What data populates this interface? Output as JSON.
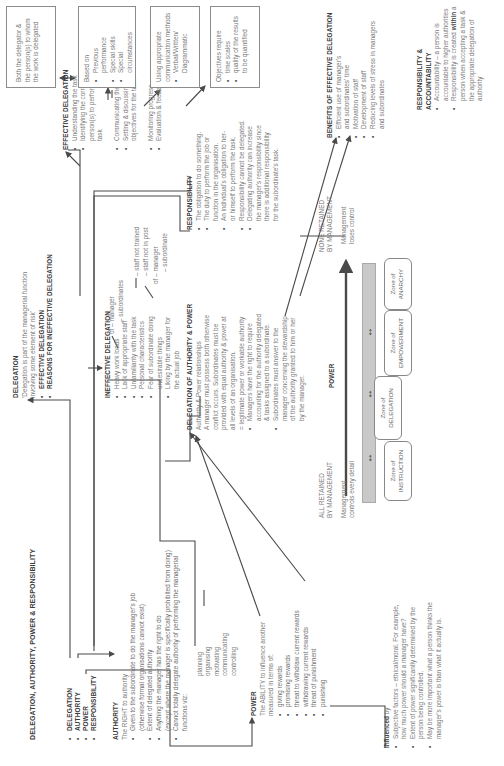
{
  "title": "DELEGATION, AUTHORITY, POWER & RESPONSIBILITY",
  "topics": [
    "DELEGATION",
    "AUTHORITY",
    "POWER",
    "RESPONSIBILITY"
  ],
  "authority": {
    "heading": "AUTHORITY",
    "intro": "The RIGHT to authority",
    "items": [
      "Given to the subordinate to do the manager's job",
      "(otherwise formal organisations cannot exist)",
      "Extent of delegated authority",
      "Anything the manager has the right to do",
      "(except where the manager is specifically prohibited from doing)",
      "Cannot totally delegate authority of performing the managerial",
      "functions viz:"
    ],
    "functions": [
      "planning",
      "organising",
      "motivating",
      "communicating",
      "controlling"
    ]
  },
  "power": {
    "heading": "POWER",
    "intro": "The ABILITY to influence another",
    "intro2": "measured in terms of:",
    "items": [
      "giving rewards",
      "promising rewards",
      "threat to withdraw current rewards",
      "withdrawing current rewards",
      "threat of punishment",
      "punishing"
    ]
  },
  "influenced": {
    "heading": "Influenced",
    "heading_suffix": " by",
    "items": [
      "Subjective factors – ethical/moral. For example,",
      "how much power should a manager have?",
      "Extent of power significantly determined by the",
      "person being controlled.",
      "May be more important what a person thinks the",
      "manager's power is than what it actually is."
    ]
  },
  "delegation": {
    "heading": "DELEGATION",
    "quote1": "'Delegation is part of the managerial function",
    "quote2": "involving some element of risk'",
    "items": [
      "EFFECTIVE DELEGATION",
      "REASONS FOR INEFFECTIVE DELEGATION"
    ]
  },
  "ineffective": {
    "heading": "INEFFECTIVE DELEGATION",
    "items": [
      "Heavy work loads",
      "Lack of appropriate staff",
      "Unfamiliarity with the task",
      "Personal characteristics",
      "Fear of subordinate doing",
      "undesirable things",
      "Liking by the manager for",
      "the actual job"
    ],
    "notes": {
      "of1": "of – manager",
      "sub1": "– subordinates",
      "staff1": "– staff not trained",
      "staff2": "– staff not in post",
      "of2": "of – manager",
      "sub2": "– subordinate"
    }
  },
  "effective": {
    "heading": "EFFECTIVE DELEGATION",
    "items": [
      "Understanding the task",
      "Identifying the correct",
      "person(s) to perform the",
      "task",
      "Communicating the task",
      "Setting & discussing the",
      "objectives for the task",
      "Monitoring progress",
      "Evaluation & feedback"
    ]
  },
  "boxes": {
    "both": [
      "Both the delegator &",
      "the person(s) to whom",
      "the work is delegated"
    ],
    "based_on": {
      "label": "Based on",
      "items": [
        "Previous performance",
        "Special skills",
        "Special circumstances"
      ]
    },
    "communication": {
      "label1": "Using appropriate",
      "label2": "communication methods",
      "items": [
        "Verbal/Written/",
        "Diagrammatic"
      ]
    },
    "objectives": {
      "label": "Objectives require",
      "items": [
        "time scales",
        "quality of the results",
        "to be quantified"
      ]
    }
  },
  "responsibility": {
    "heading": "RESPONSIBILITY",
    "items": [
      "The obligation to do something.",
      "The duty to perform the job or",
      "function in the organisation.",
      "An individual's obligation to her-",
      "or himself to perform the task.",
      "Responsibility cannot be delegated.",
      "Delegating authority can increase",
      "the manager's responsibility since",
      "there is additional responsibility",
      "for the subordinate's task."
    ]
  },
  "doa": {
    "heading": "DELEGATION OF AUTHORITY & POWER",
    "lines": [
      "Authority & Power relationships",
      "A manager must possess both otherwise",
      "conflict occurs. Subordinates must be",
      "provided with equal authority & power at",
      "all levels of an organisation.",
      "= legitimate power or workable authority"
    ],
    "items": [
      "Managers have the right to require",
      "accounting for the authority delegated",
      "& tasks assigned to a subordinate.",
      "Subordinates must answer to the",
      "manager concerning the stewardship",
      "of the authority granted to him or her",
      "by the manager."
    ]
  },
  "benefits": {
    "heading": "BENEFITS OF EFFECTIVE DELEGATION",
    "items": [
      "Efficient use of manager's",
      "and subordinates' time",
      "Motivation of staff",
      "Development of staff",
      "Reducing levels of stress in managers",
      "and subordinates"
    ]
  },
  "accountability": {
    "heading": "RESPONSIBILITY & ACCOUNTABILITY",
    "items": [
      "Accountability – a person is",
      "accountable to higher authorities",
      "Responsibility is created ",
      "within",
      " a",
      "person when accepting a task &",
      "the appropriate delegation of",
      "authority"
    ]
  },
  "power_scale": {
    "label": "POWER",
    "left_title1": "ALL RETAINED",
    "left_title2": "BY MANAGEMENT",
    "left_sub1": "Management",
    "left_sub2": "controls every detail",
    "right_title1": "NONE RETAINED",
    "right_title2": "BY MANAGEMENT",
    "right_sub1": "Management",
    "right_sub2": "loses control",
    "zones": [
      {
        "l1": "Zone of",
        "l2": "INSTRUCTION"
      },
      {
        "l1": "Zone of",
        "l2": "DELEGATION"
      },
      {
        "l1": "Zone of",
        "l2": "EMPOWERMENT"
      },
      {
        "l1": "Zone of",
        "l2": "ANARCHY"
      }
    ]
  }
}
